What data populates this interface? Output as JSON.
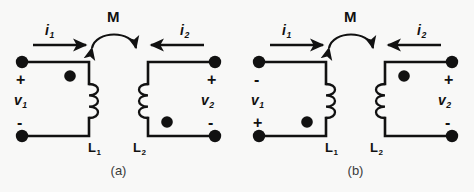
{
  "figure": {
    "type": "circuit-diagram",
    "background_color": "#f8f8f7",
    "ink_color": "#111111"
  },
  "panels": [
    {
      "id": "a",
      "caption": "(a)",
      "mutual_label": "M",
      "left_circuit": {
        "current_label": "i",
        "current_sub": "1",
        "current_direction": "right",
        "voltage_label": "v",
        "voltage_sub": "1",
        "top_sign": "+",
        "bottom_sign": "-",
        "inductor_label": "L",
        "inductor_sub": "1",
        "dot_position": "top"
      },
      "right_circuit": {
        "current_label": "i",
        "current_sub": "2",
        "current_direction": "left",
        "voltage_label": "v",
        "voltage_sub": "2",
        "top_sign": "+",
        "bottom_sign": "-",
        "inductor_label": "L",
        "inductor_sub": "2",
        "dot_position": "bottom"
      }
    },
    {
      "id": "b",
      "caption": "(b)",
      "mutual_label": "M",
      "left_circuit": {
        "current_label": "i",
        "current_sub": "1",
        "current_direction": "right",
        "voltage_label": "v",
        "voltage_sub": "1",
        "top_sign": "-",
        "bottom_sign": "+",
        "inductor_label": "L",
        "inductor_sub": "1",
        "dot_position": "bottom"
      },
      "right_circuit": {
        "current_label": "i",
        "current_sub": "2",
        "current_direction": "left",
        "voltage_label": "v",
        "voltage_sub": "2",
        "top_sign": "+",
        "bottom_sign": "-",
        "inductor_label": "L",
        "inductor_sub": "2",
        "dot_position": "top"
      }
    }
  ]
}
